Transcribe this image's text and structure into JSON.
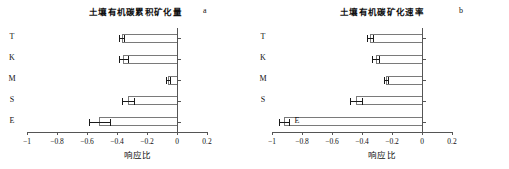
{
  "figure": {
    "panels": [
      {
        "letter": "a",
        "title": "土壤有机碳累积矿化量",
        "xlabel": "响应比"
      },
      {
        "letter": "b",
        "title": "土壤有机碳矿化速率",
        "xlabel": "响应比"
      }
    ]
  },
  "chart_data": [
    {
      "type": "bar",
      "orientation": "horizontal",
      "title": "土壤有机碳累积矿化量",
      "panel_label": "a",
      "xlabel": "响应比",
      "ylabel": "",
      "xlim": [
        -1,
        0.2
      ],
      "xticks": [
        -1,
        -0.8,
        -0.6,
        -0.4,
        -0.2,
        0,
        0.2
      ],
      "xticklabels": [
        "-1",
        "-0.8",
        "-0.6",
        "-0.4",
        "-0.2",
        "0",
        "0.2"
      ],
      "categories": [
        "T",
        "K",
        "M",
        "S",
        "E"
      ],
      "values": [
        -0.37,
        -0.36,
        -0.06,
        -0.33,
        -0.52
      ],
      "errors": [
        0.015,
        0.03,
        0.015,
        0.04,
        0.07
      ],
      "grid": false,
      "legend": null
    },
    {
      "type": "bar",
      "orientation": "horizontal",
      "title": "土壤有机碳矿化速率",
      "panel_label": "b",
      "xlabel": "响应比",
      "ylabel": "",
      "xlim": [
        -1,
        0.2
      ],
      "xticks": [
        -1,
        -0.8,
        -0.6,
        -0.4,
        -0.2,
        0,
        0.2
      ],
      "xticklabels": [
        "-1",
        "-0.8",
        "-0.6",
        "-0.4",
        "-0.2",
        "0",
        "0.2"
      ],
      "categories": [
        "T",
        "K",
        "M",
        "S",
        "E"
      ],
      "values": [
        -0.35,
        -0.31,
        -0.24,
        -0.44,
        -0.92
      ],
      "errors": [
        0.02,
        0.025,
        0.015,
        0.04,
        0.035
      ],
      "grid": false,
      "legend": null
    }
  ],
  "style": {
    "bar_outline_color": "#7a7a7a",
    "error_bar_color": "#1a1a1a",
    "axis_color": "#555555",
    "background": "#ffffff"
  }
}
